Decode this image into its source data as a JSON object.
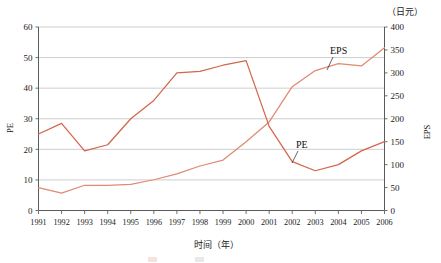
{
  "chart_data": {
    "type": "line",
    "title": "",
    "xlabel": "时间（年）",
    "ylabel": "PE",
    "y2label": "EPS",
    "unit_note": "（日元）",
    "grid": true,
    "legend_position": "inline-annotation",
    "categories": [
      "1991",
      "1992",
      "1993",
      "1994",
      "1995",
      "1996",
      "1997",
      "1998",
      "1999",
      "2000",
      "2001",
      "2002",
      "2003",
      "2004",
      "2005",
      "2006"
    ],
    "ylim": [
      0,
      60
    ],
    "y2lim": [
      0,
      400
    ],
    "yticks": [
      0,
      10,
      20,
      30,
      40,
      50,
      60
    ],
    "y2ticks": [
      0,
      50,
      100,
      150,
      200,
      250,
      300,
      350,
      400
    ],
    "series": [
      {
        "name": "PE",
        "axis": "left",
        "color": "#D4654A",
        "values": [
          25,
          28.5,
          19.5,
          21.5,
          30,
          36,
          45,
          45.5,
          47.5,
          49,
          27.5,
          16,
          13,
          15,
          19.5,
          22.5
        ]
      },
      {
        "name": "EPS",
        "axis": "right",
        "color": "#E08A72",
        "values": [
          50,
          38,
          55,
          55,
          57,
          67,
          80,
          97,
          110,
          150,
          193,
          270,
          305,
          320,
          315,
          355
        ]
      }
    ],
    "annotations": [
      {
        "text": "EPS",
        "series": "EPS"
      },
      {
        "text": "PE",
        "series": "PE"
      }
    ]
  },
  "axes": {
    "left_title": "PE",
    "right_title": "EPS",
    "unit": "（日元）",
    "x_title": "时间（年）",
    "left_ticks": [
      "60",
      "50",
      "40",
      "30",
      "20",
      "10",
      "0"
    ],
    "right_ticks": [
      "400",
      "350",
      "300",
      "250",
      "200",
      "150",
      "100",
      "50",
      "0"
    ],
    "x_ticks": [
      "1991",
      "1992",
      "1993",
      "1994",
      "1995",
      "1996",
      "1997",
      "1998",
      "1999",
      "2000",
      "2001",
      "2002",
      "2003",
      "2004",
      "2005",
      "2006"
    ]
  },
  "labels": {
    "eps": "EPS",
    "pe": "PE"
  }
}
